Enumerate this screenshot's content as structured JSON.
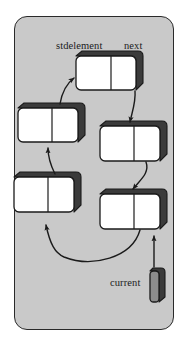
{
  "figure": {
    "panel": {
      "fill": "#c9c9c9",
      "stroke": "#2a2a2a"
    },
    "colors": {
      "node_face": "#ffffff",
      "node_shadow": "#3b3b3b",
      "node_outline": "#1b1b1b",
      "arrow": "#1b1b1b",
      "background": "#ffffff",
      "panel_fill": "#c9c9c9",
      "text": "#1b1b1b"
    }
  },
  "labels": {
    "stdelement": "stdelement",
    "next": "next",
    "current": "current"
  },
  "nodes": [
    {
      "id": "node-top",
      "x": 76,
      "y": 56,
      "w": 62,
      "h": 36,
      "cells": 2
    },
    {
      "id": "node-left-upper",
      "x": 18,
      "y": 108,
      "w": 62,
      "h": 36,
      "cells": 2
    },
    {
      "id": "node-right-middle",
      "x": 100,
      "y": 126,
      "w": 62,
      "h": 38,
      "cells": 2
    },
    {
      "id": "node-left-lower",
      "x": 14,
      "y": 177,
      "w": 62,
      "h": 38,
      "cells": 2
    },
    {
      "id": "node-right-lower",
      "x": 100,
      "y": 194,
      "w": 62,
      "h": 38,
      "cells": 2
    }
  ],
  "pointer_box": {
    "id": "current-pointer-cell",
    "x": 150,
    "y": 271,
    "w": 13,
    "h": 30
  },
  "arrows": [
    {
      "id": "arrow-left-upper-to-top",
      "from": "node-left-upper",
      "to": "node-top"
    },
    {
      "id": "arrow-top-to-right-middle",
      "from": "node-top",
      "to": "node-right-middle"
    },
    {
      "id": "arrow-right-middle-to-right-lower",
      "from": "node-right-middle",
      "to": "node-right-lower"
    },
    {
      "id": "arrow-right-lower-to-left-lower",
      "from": "node-right-lower",
      "to": "node-left-lower"
    },
    {
      "id": "arrow-left-lower-to-left-upper",
      "from": "node-left-lower",
      "to": "node-left-upper"
    },
    {
      "id": "arrow-current-to-right-lower",
      "from": "current-pointer-cell",
      "to": "node-right-lower"
    }
  ]
}
